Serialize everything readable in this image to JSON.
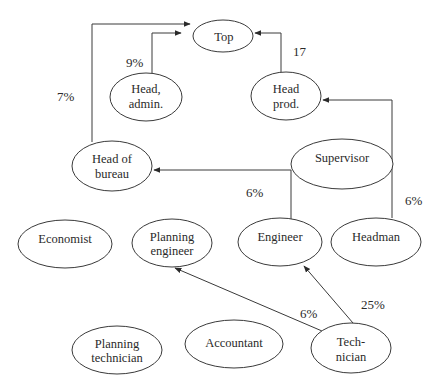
{
  "diagram": {
    "type": "organizational-influence-graph",
    "nodes": {
      "top": {
        "lines": [
          "Top"
        ],
        "cx": 223,
        "cy": 36,
        "rx": 30,
        "ry": 16
      },
      "head_admin": {
        "lines": [
          "Head,",
          "admin."
        ],
        "cx": 146,
        "cy": 97,
        "rx": 36,
        "ry": 24
      },
      "head_prod": {
        "lines": [
          "Head",
          "prod."
        ],
        "cx": 286,
        "cy": 96,
        "rx": 35,
        "ry": 24
      },
      "head_bureau": {
        "lines": [
          "Head of",
          "bureau"
        ],
        "cx": 112,
        "cy": 166,
        "rx": 40,
        "ry": 25
      },
      "supervisor": {
        "lines": [
          "Supervisor"
        ],
        "cx": 342,
        "cy": 164,
        "rx": 51,
        "ry": 25
      },
      "economist": {
        "lines": [
          "Economist"
        ],
        "cx": 65,
        "cy": 244,
        "rx": 47,
        "ry": 24
      },
      "planning_engineer": {
        "lines": [
          "Planning",
          "engineer"
        ],
        "cx": 172,
        "cy": 243,
        "rx": 40,
        "ry": 24
      },
      "engineer": {
        "lines": [
          "Engineer"
        ],
        "cx": 280,
        "cy": 242,
        "rx": 42,
        "ry": 24
      },
      "headman": {
        "lines": [
          "Headman"
        ],
        "cx": 376,
        "cy": 242,
        "rx": 45,
        "ry": 24
      },
      "planning_technician": {
        "lines": [
          "Planning",
          "technician"
        ],
        "cx": 117,
        "cy": 350,
        "rx": 45,
        "ry": 24
      },
      "accountant": {
        "lines": [
          "Accountant"
        ],
        "cx": 234,
        "cy": 344,
        "rx": 49,
        "ry": 24
      },
      "technician": {
        "lines": [
          "Tech-",
          "nician"
        ],
        "cx": 351,
        "cy": 348,
        "rx": 40,
        "ry": 25
      }
    },
    "edges": [
      {
        "from": "head_bureau",
        "to": "top",
        "label": "7%"
      },
      {
        "from": "head_admin",
        "to": "top",
        "label": "9%"
      },
      {
        "from": "head_prod",
        "to": "top",
        "label": "17"
      },
      {
        "from": "supervisor",
        "to": "head_bureau",
        "label": "6%"
      },
      {
        "from": "headman",
        "to": "head_prod",
        "label": "6%"
      },
      {
        "from": "supervisor",
        "to": "engineer",
        "label": ""
      },
      {
        "from": "technician",
        "to": "planning_engineer",
        "label": "6%"
      },
      {
        "from": "technician",
        "to": "engineer",
        "label": "25%"
      }
    ],
    "edge_labels": {
      "bureau_top": "7%",
      "admin_top": "9%",
      "prod_top": "17",
      "supervisor_bureau": "6%",
      "headman_prod": "6%",
      "tech_planning_engineer": "6%",
      "tech_engineer": "25%"
    }
  }
}
